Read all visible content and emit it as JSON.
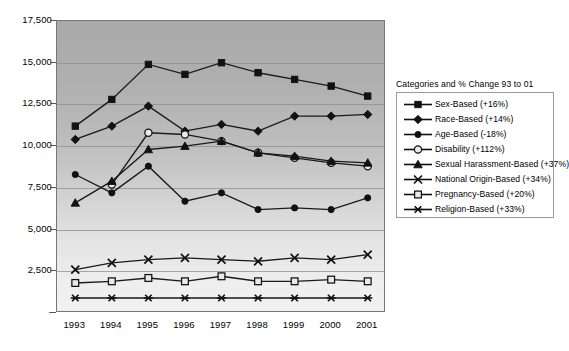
{
  "chart_data": {
    "type": "line",
    "title": "",
    "subtitle": "",
    "xlabel": "",
    "ylabel": "",
    "grid": true,
    "legend_position": "right",
    "legend_title": "Categories and % Change 93 to 01",
    "categories": [
      "1993",
      "1994",
      "1995",
      "1996",
      "1997",
      "1998",
      "1999",
      "2000",
      "2001"
    ],
    "x_tick_labels": [
      "1993",
      "1994",
      "1995",
      "1996",
      "1997",
      "1998",
      "1999",
      "2000",
      "2001"
    ],
    "y_tick_labels": [
      "-",
      "2,500",
      "5,000",
      "7,500",
      "10,000",
      "12,500",
      "15,000",
      "17,500"
    ],
    "y_tick_values": [
      0,
      2500,
      5000,
      7500,
      10000,
      12500,
      15000,
      17500
    ],
    "ylim": [
      0,
      17500
    ],
    "series": [
      {
        "name": "Sex-Based (+16%)",
        "short_name": "Sex-Based",
        "pct_change": "+16%",
        "marker": "filled-square",
        "values": [
          11200,
          12800,
          14900,
          14300,
          15000,
          14400,
          14000,
          13600,
          13000
        ]
      },
      {
        "name": "Race-Based (+14%)",
        "short_name": "Race-Based",
        "pct_change": "+14%",
        "marker": "filled-diamond",
        "values": [
          10400,
          11200,
          12400,
          10900,
          11300,
          10900,
          11800,
          11800,
          11900
        ]
      },
      {
        "name": "Age-Based (-18%)",
        "short_name": "Age-Based",
        "pct_change": "-18%",
        "marker": "filled-circle",
        "values": [
          8300,
          7200,
          8800,
          6700,
          7200,
          6200,
          6300,
          6200,
          6900
        ]
      },
      {
        "name": "Disability (+112%)",
        "short_name": "Disability",
        "pct_change": "+112%",
        "marker": "open-circle",
        "values": [
          null,
          7700,
          10800,
          10700,
          10300,
          9600,
          9300,
          9000,
          8800
        ]
      },
      {
        "name": "Sexual Harassment-Based (+37%)",
        "short_name": "Sexual Harassment-Based",
        "pct_change": "+37%",
        "marker": "filled-triangle",
        "values": [
          6600,
          7900,
          9800,
          10000,
          10300,
          9600,
          9400,
          9100,
          9000
        ]
      },
      {
        "name": "National Origin-Based (+34%)",
        "short_name": "National Origin-Based",
        "pct_change": "+34%",
        "marker": "cross-x",
        "values": [
          2600,
          3000,
          3200,
          3300,
          3200,
          3100,
          3300,
          3200,
          3500
        ]
      },
      {
        "name": "Pregnancy-Based (+20%)",
        "short_name": "Pregnancy-Based",
        "pct_change": "+20%",
        "marker": "open-square",
        "values": [
          1800,
          1900,
          2100,
          1900,
          2200,
          1900,
          1900,
          2000,
          1900
        ]
      },
      {
        "name": "Religion-Based (+33%)",
        "short_name": "Religion-Based",
        "pct_change": "+33%",
        "marker": "asterisk",
        "values": [
          900,
          900,
          900,
          900,
          900,
          900,
          900,
          900,
          900
        ]
      }
    ]
  },
  "legend": {
    "title": "Categories and % Change 93 to 01",
    "items": [
      {
        "label": "Sex-Based (+16%)",
        "marker": "filled-square"
      },
      {
        "label": "Race-Based (+14%)",
        "marker": "filled-diamond"
      },
      {
        "label": "Age-Based (-18%)",
        "marker": "filled-circle"
      },
      {
        "label": "Disability (+112%)",
        "marker": "open-circle"
      },
      {
        "label": "Sexual Harassment-Based (+37%)",
        "marker": "filled-triangle"
      },
      {
        "label": "National Origin-Based (+34%)",
        "marker": "cross-x"
      },
      {
        "label": "Pregnancy-Based (+20%)",
        "marker": "open-square"
      },
      {
        "label": "Religion-Based (+33%)",
        "marker": "asterisk"
      }
    ]
  },
  "colors": {
    "series_stroke": "#111111",
    "plot_bg_top": "#a9a9a9",
    "plot_bg_bottom": "#f2f2f2",
    "gridline": "#8d8d8d",
    "page_bg": "#ffffff"
  }
}
